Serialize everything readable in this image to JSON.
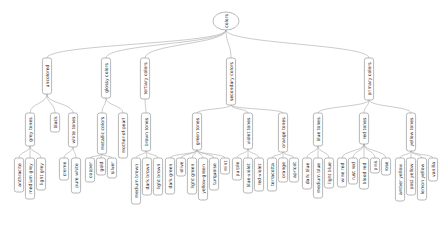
{
  "diagram": {
    "type": "tree",
    "orientation": "vertical-tree-rotated-labels",
    "root": {
      "id": "colors",
      "label": "colors",
      "shape": "ellipse"
    },
    "level1": [
      {
        "id": "uncolored",
        "label": "uncolored"
      },
      {
        "id": "glossy",
        "label": "glossy colors"
      },
      {
        "id": "tertiary",
        "label": "tertiary colors"
      },
      {
        "id": "secondary",
        "label": "secondary colors"
      },
      {
        "id": "primary",
        "label": "primary colors"
      }
    ],
    "level2": [
      {
        "id": "grey-tones",
        "label": "grey tones",
        "parent": "uncolored"
      },
      {
        "id": "black",
        "label": "black",
        "parent": "uncolored"
      },
      {
        "id": "white-tones",
        "label": "white tones",
        "parent": "uncolored"
      },
      {
        "id": "metallic-colors",
        "label": "metallic colors",
        "parent": "glossy"
      },
      {
        "id": "mother-of-pearl",
        "label": "mother-of-pearl",
        "parent": "glossy"
      },
      {
        "id": "brown-tones",
        "label": "brown tones",
        "parent": "tertiary"
      },
      {
        "id": "green-tones",
        "label": "green tones",
        "parent": "secondary"
      },
      {
        "id": "violet-tones",
        "label": "violet tones",
        "parent": "secondary"
      },
      {
        "id": "orange-tones",
        "label": "orange tones",
        "parent": "secondary"
      },
      {
        "id": "blue-tones",
        "label": "blue tones",
        "parent": "primary"
      },
      {
        "id": "red-tones",
        "label": "red tones",
        "parent": "primary"
      },
      {
        "id": "yellow-tones",
        "label": "yellow tones",
        "parent": "primary"
      }
    ],
    "level3": [
      {
        "label": "anthracite",
        "parent": "grey-tones"
      },
      {
        "label": "medium grey",
        "parent": "grey-tones"
      },
      {
        "label": "light grey",
        "parent": "grey-tones"
      },
      {
        "label": "creme",
        "parent": "white-tones"
      },
      {
        "label": "pure white",
        "parent": "white-tones"
      },
      {
        "label": "copper",
        "parent": "metallic-colors"
      },
      {
        "label": "gold",
        "parent": "metallic-colors"
      },
      {
        "label": "silver",
        "parent": "metallic-colors"
      },
      {
        "label": "medium brown",
        "parent": "brown-tones"
      },
      {
        "label": "dark brown",
        "parent": "brown-tones"
      },
      {
        "label": "light brown",
        "parent": "brown-tones"
      },
      {
        "label": "dark green",
        "parent": "green-tones"
      },
      {
        "label": "olive",
        "parent": "green-tones"
      },
      {
        "label": "light green",
        "parent": "green-tones"
      },
      {
        "label": "yellow-green",
        "parent": "green-tones"
      },
      {
        "label": "turquoise",
        "parent": "green-tones"
      },
      {
        "label": "mint",
        "parent": "green-tones"
      },
      {
        "label": "purple",
        "parent": "violet-tones"
      },
      {
        "label": "blue-violet",
        "parent": "violet-tones"
      },
      {
        "label": "red-violet",
        "parent": "violet-tones"
      },
      {
        "label": "terracotta",
        "parent": "orange-tones"
      },
      {
        "label": "orange",
        "parent": "orange-tones"
      },
      {
        "label": "apricot",
        "parent": "orange-tones"
      },
      {
        "label": "dark blue",
        "parent": "blue-tones"
      },
      {
        "label": "medium blue",
        "parent": "blue-tones"
      },
      {
        "label": "light blue",
        "parent": "blue-tones"
      },
      {
        "label": "wine red",
        "parent": "red-tones"
      },
      {
        "label": "rust red",
        "parent": "red-tones"
      },
      {
        "label": "blood red",
        "parent": "red-tones"
      },
      {
        "label": "pink",
        "parent": "red-tones"
      },
      {
        "label": "rose",
        "parent": "red-tones"
      },
      {
        "label": "amber yellow",
        "parent": "yellow-tones"
      },
      {
        "label": "post yellow",
        "parent": "yellow-tones"
      },
      {
        "label": "lemon yellow",
        "parent": "yellow-tones"
      },
      {
        "label": "vanilla",
        "parent": "yellow-tones"
      }
    ],
    "colors": {
      "node_fill": "#ffffff",
      "node_stroke": "#9a9a9a",
      "edge_stroke": "#a8a8a8",
      "text": "#111111",
      "background": "#ffffff"
    },
    "layout": {
      "root": {
        "x": 226,
        "y": 21,
        "rx": 13,
        "ry": 9
      },
      "level1_y": 58,
      "level2_y": 113,
      "level3_y": 158,
      "level1_nodes": [
        {
          "id": "uncolored",
          "x": 47,
          "w": 36
        },
        {
          "id": "glossy",
          "x": 106,
          "w": 40
        },
        {
          "id": "tertiary",
          "x": 145,
          "w": 41
        },
        {
          "id": "secondary",
          "x": 231,
          "w": 47
        },
        {
          "id": "primary",
          "x": 369,
          "w": 42
        }
      ],
      "level2_nodes": [
        {
          "id": "grey-tones",
          "x": 30,
          "w": 33
        },
        {
          "id": "black",
          "x": 55,
          "w": 19
        },
        {
          "id": "white-tones",
          "x": 73,
          "w": 34
        },
        {
          "id": "metallic-colors",
          "x": 102,
          "w": 41
        },
        {
          "id": "mother-of-pearl",
          "x": 123,
          "w": 45
        },
        {
          "id": "brown-tones",
          "x": 146,
          "w": 38
        },
        {
          "id": "green-tones",
          "x": 197,
          "w": 37
        },
        {
          "id": "violet-tones",
          "x": 248,
          "w": 36
        },
        {
          "id": "orange-tones",
          "x": 283,
          "w": 39
        },
        {
          "id": "blue-tones",
          "x": 318,
          "w": 33
        },
        {
          "id": "red-tones",
          "x": 364,
          "w": 31
        },
        {
          "id": "yellow-tones",
          "x": 411,
          "w": 38
        }
      ],
      "level3_nodes": [
        {
          "label": "anthracite",
          "x": 19,
          "w": 34
        },
        {
          "label": "medium grey",
          "x": 30,
          "w": 41
        },
        {
          "label": "light grey",
          "x": 41,
          "w": 32
        },
        {
          "label": "creme",
          "x": 64,
          "w": 22
        },
        {
          "label": "pure white",
          "x": 76,
          "w": 35
        },
        {
          "label": "copper",
          "x": 90,
          "w": 24
        },
        {
          "label": "gold",
          "x": 101,
          "w": 17
        },
        {
          "label": "silver",
          "x": 112,
          "w": 20
        },
        {
          "label": "medium brown",
          "x": 136,
          "w": 46
        },
        {
          "label": "dark brown",
          "x": 147,
          "w": 37
        },
        {
          "label": "light brown",
          "x": 158,
          "w": 37
        },
        {
          "label": "dark green",
          "x": 170,
          "w": 36
        },
        {
          "label": "olive",
          "x": 181,
          "w": 18
        },
        {
          "label": "light green",
          "x": 192,
          "w": 36
        },
        {
          "label": "yellow-green",
          "x": 203,
          "w": 42
        },
        {
          "label": "turquoise",
          "x": 214,
          "w": 32
        },
        {
          "label": "mint",
          "x": 225,
          "w": 16
        },
        {
          "label": "purple",
          "x": 237,
          "w": 22
        },
        {
          "label": "blue-violet",
          "x": 248,
          "w": 35
        },
        {
          "label": "red-violet",
          "x": 259,
          "w": 33
        },
        {
          "label": "terracotta",
          "x": 272,
          "w": 33
        },
        {
          "label": "orange",
          "x": 283,
          "w": 24
        },
        {
          "label": "apricot",
          "x": 294,
          "w": 24
        },
        {
          "label": "dark blue",
          "x": 307,
          "w": 31
        },
        {
          "label": "medium blue",
          "x": 318,
          "w": 40
        },
        {
          "label": "light blue",
          "x": 329,
          "w": 30
        },
        {
          "label": "wine red",
          "x": 342,
          "w": 29
        },
        {
          "label": "rust red",
          "x": 353,
          "w": 26
        },
        {
          "label": "blood red",
          "x": 364,
          "w": 31
        },
        {
          "label": "pink",
          "x": 375,
          "w": 15
        },
        {
          "label": "rose",
          "x": 386,
          "w": 17
        },
        {
          "label": "amber yellow",
          "x": 400,
          "w": 43
        },
        {
          "label": "post yellow",
          "x": 411,
          "w": 37
        },
        {
          "label": "lemon yellow",
          "x": 422,
          "w": 42
        },
        {
          "label": "vanilla",
          "x": 433,
          "w": 23
        }
      ]
    }
  }
}
